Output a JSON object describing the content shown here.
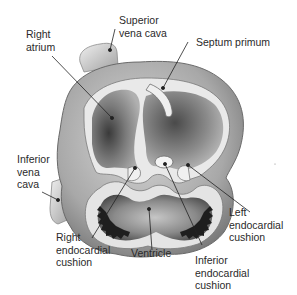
{
  "diagram": {
    "labels": {
      "right_atrium": "Right\natrium",
      "superior_vena_cava": "Superior\nvena cava",
      "septum_primum": "Septum primum",
      "inferior_vena_cava": "Inferior\nvena\ncava",
      "right_endocardial_cushion": "Right\nendocardial\ncushion",
      "ventricle": "Ventricle",
      "inferior_endocardial_cushion": "Inferior\nendocardial\ncushion",
      "left_endocardial_cushion": "Left\nendocardial\ncushion"
    },
    "colors": {
      "background": "#ffffff",
      "text": "#2a2a2a",
      "leader_line": "#222222",
      "wall_light": "#e6e6e6",
      "wall_mid": "#b5b5b5",
      "cavity_dark": "#4a4a4a",
      "trabeculae": "#1e1e1e"
    }
  }
}
